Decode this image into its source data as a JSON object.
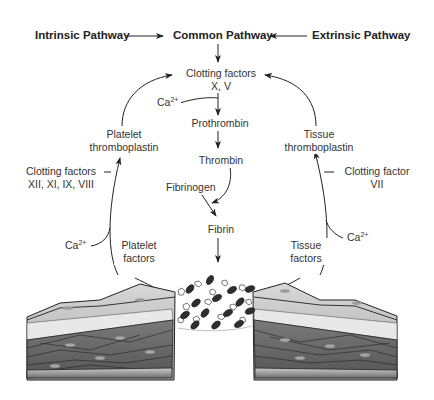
{
  "diagram": {
    "type": "coagulation cascade",
    "headers": {
      "intrinsic": "Intrinsic Pathway",
      "common": "Common Pathway",
      "extrinsic": "Extrinsic Pathway"
    },
    "center": {
      "clotting_factors_line1": "Clotting factors",
      "clotting_factors_line2": "X, V",
      "prothrombin": "Prothrombin",
      "thrombin": "Thrombin",
      "fibrinogen": "Fibrinogen",
      "fibrin": "Fibrin"
    },
    "left": {
      "platelet_thromboplastin_line1": "Platelet",
      "platelet_thromboplastin_line2": "thromboplastin",
      "clotting_factors_line1": "Clotting factors",
      "clotting_factors_line2": "XII, XI, IX, VIII",
      "platelet_factors_line1": "Platelet",
      "platelet_factors_line2": "factors"
    },
    "right": {
      "tissue_thromboplastin_line1": "Tissue",
      "tissue_thromboplastin_line2": "thromboplastin",
      "clotting_factor_line1": "Clotting factor",
      "clotting_factor_line2": "VII",
      "tissue_factors_line1": "Tissue",
      "tissue_factors_line2": "factors"
    },
    "calcium": {
      "base": "Ca",
      "charge": "2+"
    },
    "illustration": "cross-section of injured blood vessel wall with platelets and red blood cells forming clot"
  }
}
